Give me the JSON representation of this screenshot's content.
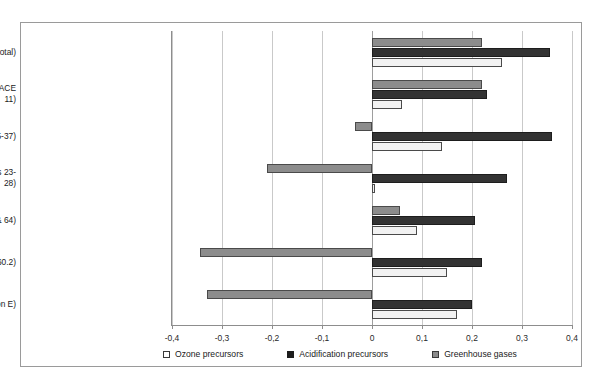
{
  "chart_data": {
    "type": "bar",
    "orientation": "horizontal",
    "title": "",
    "subtitle": "",
    "xlabel": "",
    "ylabel": "",
    "xlim": [
      -0.4,
      0.4
    ],
    "xticks": [
      "-0,4",
      "-0,3",
      "-0,2",
      "-0,1",
      "0",
      "0,1",
      "0,2",
      "0,3",
      "0,4"
    ],
    "xtick_values": [
      -0.4,
      -0.3,
      -0.2,
      -0.1,
      0,
      0.1,
      0.2,
      0.3,
      0.4
    ],
    "grid": true,
    "legend_position": "bottom",
    "categories": [
      "Norw ay (total)",
      "Extraction of crude petroleum and natural gas (NACE 11)",
      "Manufacturing (NACE Divisions 15-37)",
      "Metals and chemical industries (NACE Divisions 23-28)",
      "Transport (Section I excluding division 63 & 64)",
      "Other land transport (NACE Group 60.2)",
      "Electricity, gas and w ater supply (Section E)"
    ],
    "series": [
      {
        "name": "Ozone precursors",
        "color": "#f2f2f2",
        "values": [
          0.26,
          0.06,
          0.14,
          0.005,
          0.09,
          0.15,
          0.17
        ]
      },
      {
        "name": "Acidification precursors",
        "color": "#333333",
        "values": [
          0.355,
          0.23,
          0.36,
          0.27,
          0.205,
          0.22,
          0.2
        ]
      },
      {
        "name": "Greenhouse gases",
        "color": "#8c8c8c",
        "values": [
          0.22,
          0.22,
          -0.035,
          -0.21,
          0.055,
          -0.345,
          -0.33
        ]
      }
    ]
  }
}
